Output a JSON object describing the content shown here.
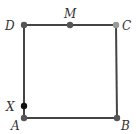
{
  "diagram": {
    "type": "geometry-square",
    "colors": {
      "edge": "#444444",
      "point": "#555555",
      "point_c": "#999999",
      "point_x": "#111111",
      "label": "#333333"
    },
    "points": {
      "A": {
        "label": "A",
        "x": 24,
        "y": 118
      },
      "B": {
        "label": "B",
        "x": 117,
        "y": 118
      },
      "C": {
        "label": "C",
        "x": 116,
        "y": 25
      },
      "D": {
        "label": "D",
        "x": 24,
        "y": 25
      },
      "M": {
        "label": "M",
        "x": 70,
        "y": 25
      },
      "X": {
        "label": "X",
        "x": 24,
        "y": 106
      }
    },
    "edges": [
      [
        "A",
        "B"
      ],
      [
        "B",
        "C"
      ],
      [
        "C",
        "D"
      ],
      [
        "D",
        "A"
      ]
    ]
  }
}
